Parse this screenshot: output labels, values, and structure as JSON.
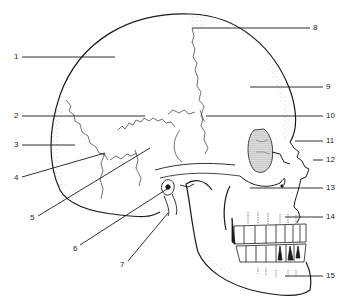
{
  "diagram": {
    "colors": {
      "ink": "#1a1a1a",
      "background": "#ffffff",
      "stipple": "#9a9a9a"
    },
    "labels": [
      {
        "num": "1",
        "x": 14,
        "y": 53,
        "side": "left",
        "line": [
          22,
          57,
          115,
          57
        ]
      },
      {
        "num": "2",
        "x": 14,
        "y": 112,
        "side": "left",
        "line": [
          22,
          116,
          145,
          116
        ]
      },
      {
        "num": "3",
        "x": 14,
        "y": 141,
        "side": "left",
        "line": [
          22,
          145,
          75,
          145
        ]
      },
      {
        "num": "4",
        "x": 14,
        "y": 174,
        "side": "left",
        "line": [
          22,
          177,
          105,
          153
        ]
      },
      {
        "num": "5",
        "x": 30,
        "y": 214,
        "side": "left",
        "line": [
          38,
          216,
          150,
          148
        ]
      },
      {
        "num": "6",
        "x": 73,
        "y": 245,
        "side": "left",
        "line": [
          80,
          245,
          167,
          189
        ]
      },
      {
        "num": "7",
        "x": 120,
        "y": 261,
        "side": "left",
        "line": [
          128,
          261,
          168,
          213
        ]
      },
      {
        "num": "8",
        "x": 313,
        "y": 24,
        "side": "right",
        "line": [
          192,
          28,
          310,
          28
        ]
      },
      {
        "num": "9",
        "x": 326,
        "y": 83,
        "side": "right",
        "line": [
          250,
          87,
          323,
          87
        ]
      },
      {
        "num": "10",
        "x": 326,
        "y": 112,
        "side": "right",
        "line": [
          206,
          116,
          323,
          116
        ]
      },
      {
        "num": "11",
        "x": 326,
        "y": 137,
        "side": "right",
        "line": [
          295,
          141,
          323,
          141
        ]
      },
      {
        "num": "12",
        "x": 326,
        "y": 156,
        "side": "right",
        "line": [
          313,
          160,
          323,
          160
        ]
      },
      {
        "num": "13",
        "x": 326,
        "y": 184,
        "side": "right",
        "line": [
          250,
          188,
          323,
          188
        ]
      },
      {
        "num": "14",
        "x": 326,
        "y": 213,
        "side": "right",
        "line": [
          285,
          217,
          323,
          217
        ]
      },
      {
        "num": "15",
        "x": 326,
        "y": 272,
        "side": "right",
        "line": [
          285,
          276,
          323,
          276
        ]
      }
    ]
  }
}
